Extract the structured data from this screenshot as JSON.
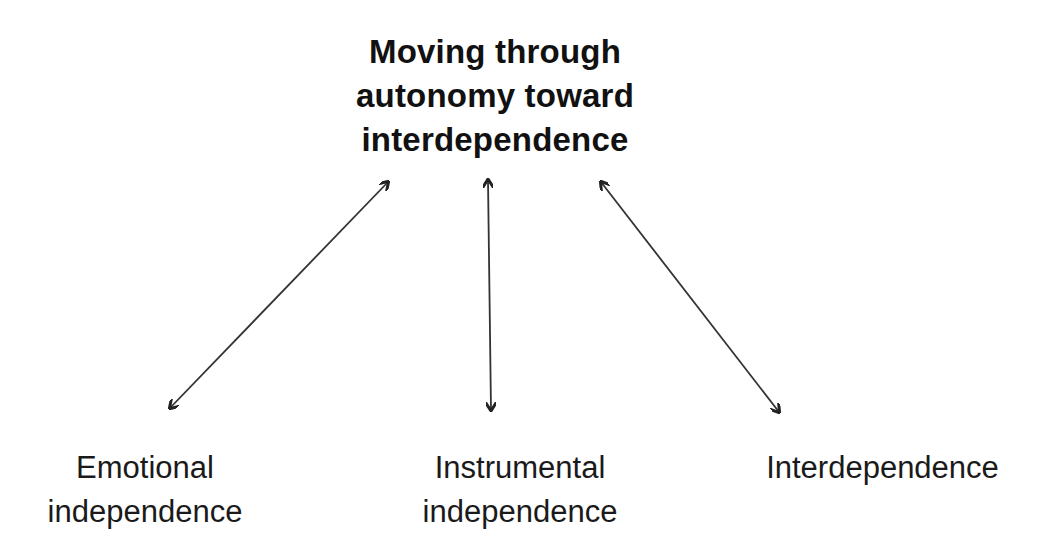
{
  "title": {
    "lines": [
      "Moving through",
      "autonomy toward",
      "interdependence"
    ]
  },
  "nodes": [
    {
      "id": "emotional",
      "lines": [
        "Emotional",
        "independence"
      ]
    },
    {
      "id": "instrumental",
      "lines": [
        "Instrumental",
        "independence"
      ]
    },
    {
      "id": "interdependence",
      "lines": [
        "Interdependence"
      ]
    }
  ],
  "edges": [
    {
      "from": "title",
      "to": "emotional",
      "type": "bidirectional-arrow"
    },
    {
      "from": "title",
      "to": "instrumental",
      "type": "bidirectional-arrow"
    },
    {
      "from": "title",
      "to": "interdependence",
      "type": "bidirectional-arrow"
    }
  ],
  "colors": {
    "text": "#111111",
    "arrow": "#222222",
    "background": "#ffffff"
  }
}
